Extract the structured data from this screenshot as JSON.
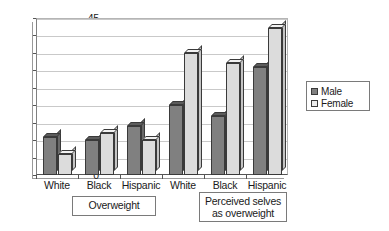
{
  "chart_data": {
    "type": "bar",
    "title": "",
    "subtitle": "",
    "xlabel": "",
    "ylabel": "",
    "ylim": [
      0,
      45
    ],
    "ytick_step": 5,
    "yticks": [
      "45",
      "40",
      "35",
      "30",
      "25",
      "20",
      "15",
      "10",
      "5",
      "0"
    ],
    "grid": true,
    "grid_axis": "y",
    "legend_position": "right",
    "style_note": "3D-effect clustered column chart",
    "categories": [
      "White",
      "Black",
      "Hispanic",
      "White",
      "Black",
      "Hispanic"
    ],
    "group_labels": [
      "Overweight",
      "Perceived selves as overweight"
    ],
    "series": [
      {
        "name": "Male",
        "color": "#808080",
        "values": [
          11,
          10,
          14,
          20,
          17,
          31
        ]
      },
      {
        "name": "Female",
        "color": "#dcdcdc",
        "values": [
          6,
          12,
          10,
          35,
          32,
          42
        ]
      }
    ],
    "groups": [
      {
        "label": "Overweight",
        "categories": [
          "White",
          "Black",
          "Hispanic"
        ],
        "Male": [
          11,
          10,
          14
        ],
        "Female": [
          6,
          12,
          10
        ]
      },
      {
        "label": "Perceived selves as overweight",
        "categories": [
          "White",
          "Black",
          "Hispanic"
        ],
        "Male": [
          20,
          17,
          31
        ],
        "Female": [
          35,
          32,
          42
        ]
      }
    ]
  },
  "axis": {
    "ticks": [
      {
        "label": "45",
        "value": 45
      },
      {
        "label": "40",
        "value": 40
      },
      {
        "label": "35",
        "value": 35
      },
      {
        "label": "30",
        "value": 30
      },
      {
        "label": "25",
        "value": 25
      },
      {
        "label": "20",
        "value": 20
      },
      {
        "label": "15",
        "value": 15
      },
      {
        "label": "10",
        "value": 10
      },
      {
        "label": "5",
        "value": 5
      },
      {
        "label": "0",
        "value": 0
      }
    ]
  },
  "xaxis": {
    "labels": [
      {
        "text": "White"
      },
      {
        "text": "Black"
      },
      {
        "text": "Hispanic"
      },
      {
        "text": "White"
      },
      {
        "text": "Black"
      },
      {
        "text": "Hispanic"
      }
    ]
  },
  "category_boxes": [
    {
      "line1": "Overweight",
      "line2": ""
    },
    {
      "line1": "Perceived selves",
      "line2": "as overweight"
    }
  ],
  "legend": {
    "items": [
      {
        "label": "Male",
        "color": "#808080"
      },
      {
        "label": "Female",
        "color": "#ececec"
      }
    ]
  }
}
